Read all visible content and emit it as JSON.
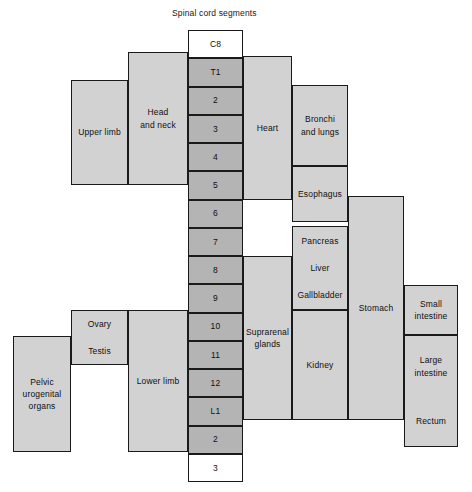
{
  "diagram": {
    "title": "Spinal cord segments",
    "title_pos": {
      "x": 172,
      "y": 8
    },
    "colors": {
      "segment_fill": "#b4b4b4",
      "segment_white_fill": "#ffffff",
      "organ_fill": "#d2d2d2",
      "stroke": "#1a1a1a",
      "text": "#101010",
      "background": "#ffffff"
    },
    "spinal_column": {
      "name": "spinal-cord-segment-column",
      "x": 188,
      "y": 30,
      "width": 55,
      "height": 452,
      "row_height": 28.25,
      "segments": [
        {
          "label": "C8",
          "fill": "white"
        },
        {
          "label": "T1",
          "fill": "gray"
        },
        {
          "label": "2",
          "fill": "gray"
        },
        {
          "label": "3",
          "fill": "gray"
        },
        {
          "label": "4",
          "fill": "gray"
        },
        {
          "label": "5",
          "fill": "gray"
        },
        {
          "label": "6",
          "fill": "gray"
        },
        {
          "label": "7",
          "fill": "gray"
        },
        {
          "label": "8",
          "fill": "gray"
        },
        {
          "label": "9",
          "fill": "gray"
        },
        {
          "label": "10",
          "fill": "gray"
        },
        {
          "label": "11",
          "fill": "gray"
        },
        {
          "label": "12",
          "fill": "gray"
        },
        {
          "label": "L1",
          "fill": "gray"
        },
        {
          "label": "2",
          "fill": "gray"
        },
        {
          "label": "3",
          "fill": "white"
        }
      ]
    },
    "organs": [
      {
        "name": "head-and-neck",
        "label": "Head\nand neck",
        "x": 128,
        "y": 52,
        "width": 60,
        "height": 133
      },
      {
        "name": "upper-limb",
        "label": "Upper limb",
        "x": 71,
        "y": 80,
        "width": 57,
        "height": 105
      },
      {
        "name": "heart",
        "label": "Heart",
        "x": 243,
        "y": 56,
        "width": 49,
        "height": 144
      },
      {
        "name": "bronchi-and-lungs",
        "label": "Bronchi\nand lungs",
        "x": 292,
        "y": 85,
        "width": 56,
        "height": 81
      },
      {
        "name": "esophagus",
        "label": "Esophagus",
        "x": 292,
        "y": 166,
        "width": 56,
        "height": 56
      },
      {
        "name": "pancreas-liver-gallbladder",
        "label": "",
        "x": 292,
        "y": 226,
        "width": 56,
        "height": 84,
        "sublabels": [
          "Pancreas",
          "Liver",
          "Gallbladder"
        ]
      },
      {
        "name": "stomach",
        "label": "Stomach",
        "x": 348,
        "y": 196,
        "width": 56,
        "height": 224
      },
      {
        "name": "supraranal-glands",
        "label": "Suprarenal\nglands",
        "x": 243,
        "y": 256,
        "width": 49,
        "height": 164
      },
      {
        "name": "kidney",
        "label": "Kidney",
        "x": 292,
        "y": 310,
        "width": 56,
        "height": 110
      },
      {
        "name": "small-intestine",
        "label": "Small\nintestine",
        "x": 404,
        "y": 285,
        "width": 54,
        "height": 50
      },
      {
        "name": "large-intestine-rectum",
        "label": "",
        "x": 404,
        "y": 335,
        "width": 54,
        "height": 112,
        "sublabels": [
          "Large\nintestine",
          "Rectum"
        ]
      },
      {
        "name": "ovary-testis",
        "label": "",
        "x": 71,
        "y": 310,
        "width": 57,
        "height": 55,
        "sublabels": [
          "Ovary",
          "Testis"
        ]
      },
      {
        "name": "lower-limb",
        "label": "Lower limb",
        "x": 128,
        "y": 310,
        "width": 60,
        "height": 142
      },
      {
        "name": "pelvic-urogenital-organs",
        "label": "Pelvic\nurogenital\norgans",
        "x": 13,
        "y": 336,
        "width": 58,
        "height": 116
      }
    ]
  }
}
